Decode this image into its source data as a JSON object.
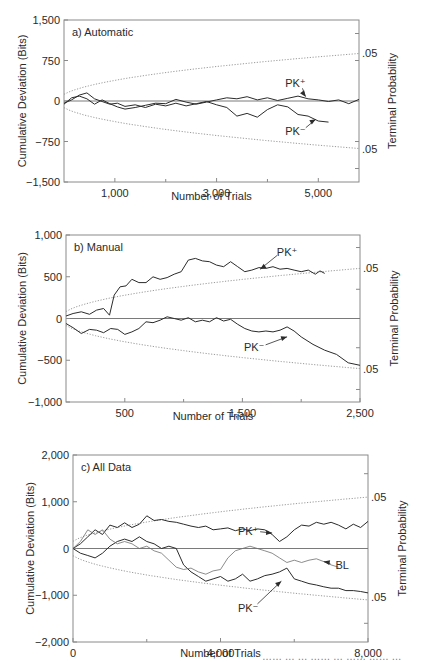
{
  "figure": {
    "caption_fragment": "……   …  … ……  … ……  …… …"
  },
  "chart_data": [
    {
      "id": "a",
      "type": "line",
      "title": "a) Automatic",
      "xlabel": "Number of Trials",
      "ylabel": "Cumulative Deviation (Bits)",
      "ylabel_right": "Terminal Probability",
      "xlim": [
        0,
        5800
      ],
      "ylim": [
        -1500,
        1500
      ],
      "yticks": [
        1500,
        750,
        0,
        -750,
        -1500
      ],
      "ytick_labels": [
        "1,500",
        "750",
        "0",
        "−1,500",
        "−750"
      ],
      "ytick_labels_ordered": [
        "1,500",
        "750",
        "0",
        "−750",
        "−1,500"
      ],
      "xticks_labeled": [
        1000,
        3000,
        5000
      ],
      "xtick_labels": [
        "1,000",
        "3,000",
        "5,000"
      ],
      "xticks_minor": [
        2000,
        4000
      ],
      "right_ticks": [
        1250,
        750,
        -750,
        -1250
      ],
      "right_labels": [
        {
          "value": 880,
          "text": ".05"
        },
        {
          "value": -880,
          "text": ".05"
        }
      ],
      "envelope": {
        "style": "dotted",
        "value_at_xmax": 880,
        "description": "p = .05 terminal probability envelope, ~ sqrt(n)"
      },
      "grid": false,
      "series": [
        {
          "name": "PK+",
          "label": "PK⁺",
          "x": [
            0,
            150,
            300,
            450,
            600,
            750,
            900,
            1050,
            1200,
            1400,
            1600,
            1800,
            2000,
            2200,
            2400,
            2600,
            2800,
            3000,
            3200,
            3400,
            3600,
            3800,
            4000,
            4200,
            4400,
            4600,
            4800,
            5000,
            5200,
            5400,
            5600,
            5800
          ],
          "y": [
            -60,
            60,
            90,
            40,
            -60,
            20,
            -50,
            -110,
            -150,
            -120,
            -80,
            -40,
            -50,
            30,
            -20,
            -60,
            -20,
            20,
            60,
            40,
            80,
            20,
            60,
            10,
            50,
            90,
            40,
            20,
            -10,
            20,
            -50,
            30
          ]
        },
        {
          "name": "PK-",
          "label": "PK⁻",
          "x": [
            0,
            150,
            300,
            450,
            600,
            750,
            900,
            1050,
            1200,
            1400,
            1600,
            1800,
            2000,
            2200,
            2400,
            2600,
            2800,
            3000,
            3200,
            3400,
            3600,
            3800,
            4000,
            4200,
            4400,
            4600,
            4800,
            5000,
            5200
          ],
          "y": [
            -40,
            20,
            110,
            150,
            40,
            -10,
            -60,
            -40,
            -100,
            -70,
            -120,
            -60,
            -90,
            -40,
            -90,
            -50,
            -10,
            -70,
            -120,
            -280,
            -230,
            -300,
            -160,
            -70,
            -110,
            -250,
            -280,
            -370,
            -390
          ]
        }
      ],
      "annotations": [
        {
          "text": "PK⁺",
          "x": 4550,
          "y": 340,
          "arrow_to": [
            4750,
            80
          ]
        },
        {
          "text": "PK⁻",
          "x": 4550,
          "y": -560,
          "arrow_to": [
            4950,
            -340
          ]
        }
      ]
    },
    {
      "id": "b",
      "type": "line",
      "title": "b) Manual",
      "xlabel": "Number of Trials",
      "ylabel": "Cumulative Deviation (Bits)",
      "ylabel_right": "Terminal Probability",
      "xlim": [
        0,
        2500
      ],
      "ylim": [
        -1000,
        1000
      ],
      "yticks": [
        1000,
        500,
        0,
        -500,
        -1000
      ],
      "ytick_labels_ordered": [
        "1,000",
        "500",
        "0",
        "−500",
        "−1,000"
      ],
      "xticks_labeled": [
        500,
        1500,
        2500
      ],
      "xtick_labels": [
        "500",
        "1,500",
        "2,500"
      ],
      "xticks_minor": [
        1000,
        2000
      ],
      "right_ticks": [
        850,
        350,
        -350,
        -850
      ],
      "right_labels": [
        {
          "value": 600,
          "text": ".05"
        },
        {
          "value": -600,
          "text": ".05"
        }
      ],
      "envelope": {
        "style": "dotted",
        "value_at_xmax": 600
      },
      "grid": false,
      "series": [
        {
          "name": "PK+",
          "label": "PK⁺",
          "x": [
            0,
            60,
            130,
            200,
            260,
            320,
            370,
            410,
            460,
            510,
            560,
            620,
            680,
            740,
            800,
            860,
            920,
            980,
            1040,
            1100,
            1160,
            1220,
            1280,
            1340,
            1400,
            1460,
            1520,
            1580,
            1640,
            1700,
            1760,
            1820,
            1880,
            1940,
            2000,
            2060,
            2120,
            2160,
            2200
          ],
          "y": [
            30,
            60,
            80,
            50,
            100,
            120,
            40,
            280,
            380,
            390,
            470,
            430,
            430,
            500,
            470,
            490,
            530,
            560,
            700,
            720,
            690,
            680,
            640,
            620,
            680,
            620,
            560,
            580,
            610,
            600,
            620,
            590,
            600,
            580,
            560,
            580,
            530,
            570,
            540
          ]
        },
        {
          "name": "PK-",
          "label": "PK⁻",
          "x": [
            0,
            60,
            130,
            200,
            260,
            320,
            380,
            440,
            500,
            560,
            620,
            680,
            740,
            800,
            860,
            920,
            980,
            1040,
            1100,
            1160,
            1220,
            1280,
            1340,
            1400,
            1460,
            1520,
            1580,
            1640,
            1700,
            1760,
            1820,
            1880,
            1940,
            2000,
            2100,
            2200,
            2300,
            2400,
            2500
          ],
          "y": [
            -60,
            -110,
            -180,
            -130,
            -140,
            -170,
            -120,
            -130,
            -190,
            -160,
            -120,
            -40,
            -50,
            -20,
            20,
            0,
            -20,
            10,
            -40,
            -20,
            -40,
            10,
            -30,
            -10,
            -70,
            -120,
            -150,
            -160,
            -150,
            -160,
            -140,
            -100,
            -150,
            -220,
            -310,
            -380,
            -430,
            -530,
            -560
          ]
        }
      ],
      "annotations": [
        {
          "text": "PK⁺",
          "x": 1880,
          "y": 800,
          "arrow_to": [
            1650,
            590
          ]
        },
        {
          "text": "PK⁻",
          "x": 1600,
          "y": -340,
          "arrow_to": [
            1880,
            -220
          ]
        }
      ]
    },
    {
      "id": "c",
      "type": "line",
      "title": "c) All Data",
      "xlabel": "Number of Trials",
      "ylabel": "Cumulative Deviation (Bits)",
      "ylabel_right": "Terminal Probability",
      "xlim": [
        0,
        8000
      ],
      "ylim": [
        -2000,
        2000
      ],
      "yticks": [
        2000,
        1000,
        0,
        -1000,
        -2000
      ],
      "ytick_labels_ordered": [
        "2,000",
        "1,000",
        "0",
        "−1,000",
        "−2,000"
      ],
      "xticks_labeled": [
        0,
        4000,
        8000
      ],
      "xtick_labels": [
        "0",
        "4,000",
        "8,000"
      ],
      "xticks_minor": [
        2000,
        6000
      ],
      "right_ticks": [
        1600,
        -1600
      ],
      "right_labels": [
        {
          "value": 1110,
          "text": ".05"
        },
        {
          "value": -1040,
          "text": ".05"
        }
      ],
      "envelope": {
        "style": "dotted",
        "value_at_xmax": 1100
      },
      "grid": false,
      "series": [
        {
          "name": "PK+",
          "label": "PK⁺",
          "x": [
            0,
            200,
            400,
            600,
            800,
            1000,
            1200,
            1400,
            1600,
            1800,
            2000,
            2200,
            2400,
            2600,
            2800,
            3000,
            3200,
            3400,
            3600,
            3800,
            4000,
            4200,
            4400,
            4600,
            4800,
            5000,
            5200,
            5400,
            5600,
            5800,
            6000,
            6200,
            6400,
            6600,
            6800,
            7000,
            7200,
            7400,
            7600,
            7800,
            8000
          ],
          "y": [
            0,
            100,
            250,
            400,
            300,
            500,
            450,
            550,
            450,
            520,
            700,
            600,
            620,
            580,
            560,
            520,
            480,
            450,
            480,
            400,
            420,
            440,
            380,
            420,
            380,
            420,
            400,
            300,
            150,
            250,
            400,
            500,
            480,
            560,
            520,
            560,
            500,
            420,
            520,
            450,
            580
          ]
        },
        {
          "name": "PK-",
          "label": "PK⁻",
          "x": [
            0,
            200,
            400,
            600,
            800,
            1000,
            1200,
            1400,
            1600,
            1800,
            2000,
            2200,
            2400,
            2600,
            2800,
            3000,
            3200,
            3400,
            3600,
            3800,
            4000,
            4200,
            4400,
            4600,
            4800,
            5000,
            5200,
            5400,
            5600,
            5800,
            6000,
            6200,
            6400,
            6600,
            6800,
            7000,
            7200,
            7400,
            7600,
            7800,
            8000
          ],
          "y": [
            0,
            -100,
            -150,
            -200,
            -100,
            50,
            150,
            200,
            150,
            250,
            150,
            100,
            0,
            50,
            0,
            -350,
            -500,
            -600,
            -700,
            -650,
            -600,
            -700,
            -650,
            -550,
            -700,
            -650,
            -580,
            -550,
            -500,
            -420,
            -650,
            -700,
            -750,
            -780,
            -820,
            -850,
            -850,
            -900,
            -900,
            -920,
            -950
          ]
        },
        {
          "name": "BL",
          "label": "BL",
          "x": [
            0,
            200,
            400,
            600,
            800,
            1000,
            1200,
            1400,
            1600,
            1800,
            2000,
            2200,
            2400,
            2600,
            2800,
            3000,
            3200,
            3400,
            3600,
            3800,
            4000,
            4200,
            4400,
            4600,
            4800,
            5000,
            5200,
            5400,
            5600,
            5800,
            6000,
            6200,
            6400,
            6600,
            6800,
            7000,
            7200
          ],
          "y": [
            0,
            150,
            400,
            300,
            400,
            200,
            100,
            150,
            100,
            0,
            50,
            -50,
            -100,
            -250,
            -400,
            -450,
            -420,
            -500,
            -550,
            -480,
            -450,
            -200,
            -50,
            0,
            50,
            0,
            -50,
            -100,
            -200,
            -300,
            -250,
            -300,
            -250,
            -220,
            -280,
            -350,
            -400
          ]
        }
      ],
      "annotations": [
        {
          "text": "PK⁺",
          "x": 4750,
          "y": 370,
          "arrow_to": [
            5400,
            330
          ]
        },
        {
          "text": "BL",
          "x": 7300,
          "y": -350,
          "arrow_to": [
            6800,
            -280
          ]
        },
        {
          "text": "PK⁻",
          "x": 4750,
          "y": -1280,
          "arrow_to": [
            5650,
            -700
          ]
        }
      ]
    }
  ],
  "panels_layout": [
    {
      "frame": [
        64,
        20,
        359,
        182
      ],
      "xlabel_y": 200,
      "ylabel_x": 40,
      "rlabel_x": 388
    },
    {
      "frame": [
        66,
        235,
        360,
        402
      ],
      "xlabel_y": 420,
      "ylabel_x": 40,
      "rlabel_x": 390
    },
    {
      "frame": [
        73,
        455,
        368,
        642
      ],
      "xlabel_y": 657,
      "ylabel_x": 48,
      "rlabel_x": 398
    }
  ]
}
